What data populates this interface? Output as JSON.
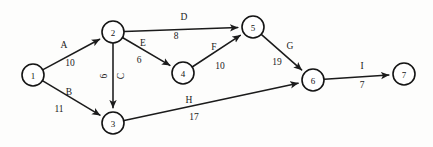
{
  "diagram": {
    "kind": "directed-network-graph",
    "title": "",
    "background_color": "#fdfdfc",
    "line_color": "#1b1b1b",
    "node_fill": "#ffffff",
    "nodes": [
      {
        "id": "1",
        "label": "1",
        "cx": 33,
        "cy": 75,
        "r": 11
      },
      {
        "id": "2",
        "label": "2",
        "cx": 113,
        "cy": 32,
        "r": 11
      },
      {
        "id": "3",
        "label": "3",
        "cx": 113,
        "cy": 123,
        "r": 11
      },
      {
        "id": "4",
        "label": "4",
        "cx": 183,
        "cy": 73,
        "r": 11
      },
      {
        "id": "5",
        "label": "5",
        "cx": 253,
        "cy": 27,
        "r": 11
      },
      {
        "id": "6",
        "label": "6",
        "cx": 313,
        "cy": 80,
        "r": 11
      },
      {
        "id": "7",
        "label": "7",
        "cx": 404,
        "cy": 74,
        "r": 11
      }
    ],
    "edges": [
      {
        "id": "A",
        "name": "A",
        "weight": "10",
        "from": "1",
        "to": "2",
        "name_x": 64,
        "name_y": 45,
        "weight_x": 70,
        "weight_y": 63,
        "rotated": false
      },
      {
        "id": "B",
        "name": "B",
        "weight": "11",
        "from": "1",
        "to": "3",
        "name_x": 69,
        "name_y": 92,
        "weight_x": 59,
        "weight_y": 109,
        "rotated": false
      },
      {
        "id": "C",
        "name": "C",
        "weight": "6",
        "from": "2",
        "to": "3",
        "name_x": 121,
        "name_y": 76,
        "weight_x": 104,
        "weight_y": 76,
        "rotated": true
      },
      {
        "id": "D",
        "name": "D",
        "weight": "8",
        "from": "2",
        "to": "5",
        "name_x": 184,
        "name_y": 17,
        "weight_x": 176,
        "weight_y": 36,
        "rotated": false
      },
      {
        "id": "E",
        "name": "E",
        "weight": "6",
        "from": "2",
        "to": "4",
        "name_x": 143,
        "name_y": 43,
        "weight_x": 139,
        "weight_y": 60,
        "rotated": false
      },
      {
        "id": "F",
        "name": "F",
        "weight": "10",
        "from": "4",
        "to": "5",
        "name_x": 214,
        "name_y": 47,
        "weight_x": 220,
        "weight_y": 66,
        "rotated": false
      },
      {
        "id": "G",
        "name": "G",
        "weight": "19",
        "from": "5",
        "to": "6",
        "name_x": 290,
        "name_y": 46,
        "weight_x": 277,
        "weight_y": 62,
        "rotated": false
      },
      {
        "id": "H",
        "name": "H",
        "weight": "17",
        "from": "3",
        "to": "6",
        "name_x": 189,
        "name_y": 100,
        "weight_x": 194,
        "weight_y": 117,
        "rotated": false
      },
      {
        "id": "I",
        "name": "I",
        "weight": "7",
        "from": "6",
        "to": "7",
        "name_x": 362,
        "name_y": 66,
        "weight_x": 362,
        "weight_y": 85,
        "rotated": false
      }
    ]
  }
}
